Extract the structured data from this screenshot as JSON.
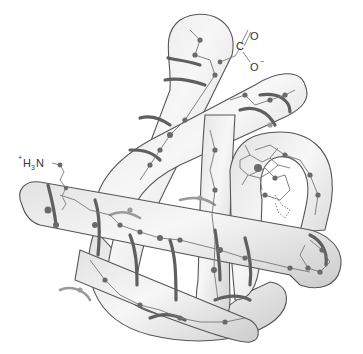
{
  "figure": {
    "labels": {
      "n_terminus": {
        "charge": "+",
        "text": "H",
        "subscript": "3",
        "suffix": "N"
      },
      "c_terminus": {
        "carbon": "C",
        "double_bond_oxygen": "O",
        "single_bond_oxygen": "O",
        "charge": "−"
      }
    },
    "colors": {
      "tube_fill_light": "#f4f4f4",
      "tube_fill_dark": "#cfcfcf",
      "outline": "#555555",
      "helix_backbone": "#5f5f5f",
      "atom": "#6a6a6a"
    }
  }
}
